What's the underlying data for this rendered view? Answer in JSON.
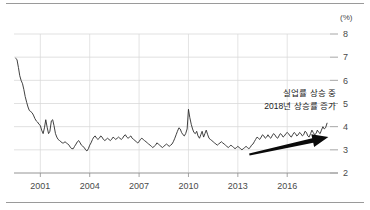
{
  "chart_data": {
    "type": "line",
    "title": "",
    "subtitle": "",
    "xlabel": "",
    "ylabel": "",
    "unit_label": "(%)",
    "xlim": [
      1999.4,
      2018.6
    ],
    "ylim": [
      2,
      8
    ],
    "grid": true,
    "legend": null,
    "y_ticks": [
      8,
      7,
      6,
      5,
      4,
      3,
      2
    ],
    "y_tick_labels": [
      "8",
      "7",
      "6",
      "5",
      "4",
      "3",
      "2"
    ],
    "x_ticks": [
      2001,
      2004,
      2007,
      2010,
      2013,
      2016
    ],
    "x_tick_labels": [
      "2001",
      "2004",
      "2007",
      "2010",
      "2013",
      "2016"
    ],
    "series": [
      {
        "name": "unemployment-rate",
        "color": "#2b2b2b",
        "x": [
          1999.5,
          1999.58,
          1999.67,
          1999.75,
          1999.83,
          1999.92,
          2000.0,
          2000.08,
          2000.17,
          2000.25,
          2000.33,
          2000.42,
          2000.5,
          2000.58,
          2000.67,
          2000.75,
          2000.83,
          2000.92,
          2001.0,
          2001.08,
          2001.17,
          2001.25,
          2001.33,
          2001.42,
          2001.5,
          2001.58,
          2001.67,
          2001.75,
          2001.83,
          2001.92,
          2002.0,
          2002.08,
          2002.17,
          2002.25,
          2002.33,
          2002.42,
          2002.5,
          2002.58,
          2002.67,
          2002.75,
          2002.83,
          2002.92,
          2003.0,
          2003.08,
          2003.17,
          2003.25,
          2003.33,
          2003.42,
          2003.5,
          2003.58,
          2003.67,
          2003.75,
          2003.83,
          2003.92,
          2004.0,
          2004.08,
          2004.17,
          2004.25,
          2004.33,
          2004.42,
          2004.5,
          2004.58,
          2004.67,
          2004.75,
          2004.83,
          2004.92,
          2005.0,
          2005.08,
          2005.17,
          2005.25,
          2005.33,
          2005.42,
          2005.5,
          2005.58,
          2005.67,
          2005.75,
          2005.83,
          2005.92,
          2006.0,
          2006.08,
          2006.17,
          2006.25,
          2006.33,
          2006.42,
          2006.5,
          2006.58,
          2006.67,
          2006.75,
          2006.83,
          2006.92,
          2007.0,
          2007.08,
          2007.17,
          2007.25,
          2007.33,
          2007.42,
          2007.5,
          2007.58,
          2007.67,
          2007.75,
          2007.83,
          2007.92,
          2008.0,
          2008.08,
          2008.17,
          2008.25,
          2008.33,
          2008.42,
          2008.5,
          2008.58,
          2008.67,
          2008.75,
          2008.83,
          2008.92,
          2009.0,
          2009.08,
          2009.17,
          2009.25,
          2009.33,
          2009.42,
          2009.5,
          2009.58,
          2009.67,
          2009.75,
          2009.83,
          2009.92,
          2010.0,
          2010.08,
          2010.17,
          2010.25,
          2010.33,
          2010.42,
          2010.5,
          2010.58,
          2010.67,
          2010.75,
          2010.83,
          2010.92,
          2011.0,
          2011.08,
          2011.17,
          2011.25,
          2011.33,
          2011.42,
          2011.5,
          2011.58,
          2011.67,
          2011.75,
          2011.83,
          2011.92,
          2012.0,
          2012.08,
          2012.17,
          2012.25,
          2012.33,
          2012.42,
          2012.5,
          2012.58,
          2012.67,
          2012.75,
          2012.83,
          2012.92,
          2013.0,
          2013.08,
          2013.17,
          2013.25,
          2013.33,
          2013.42,
          2013.5,
          2013.58,
          2013.67,
          2013.75,
          2013.83,
          2013.92,
          2014.0,
          2014.08,
          2014.17,
          2014.25,
          2014.33,
          2014.42,
          2014.5,
          2014.58,
          2014.67,
          2014.75,
          2014.83,
          2014.92,
          2015.0,
          2015.08,
          2015.17,
          2015.25,
          2015.33,
          2015.42,
          2015.5,
          2015.58,
          2015.67,
          2015.75,
          2015.83,
          2015.92,
          2016.0,
          2016.08,
          2016.17,
          2016.25,
          2016.33,
          2016.42,
          2016.5,
          2016.58,
          2016.67,
          2016.75,
          2016.83,
          2016.92,
          2017.0,
          2017.08,
          2017.17,
          2017.25,
          2017.33,
          2017.42,
          2017.5,
          2017.58,
          2017.67,
          2017.75,
          2017.83,
          2017.92,
          2018.0,
          2018.08,
          2018.17,
          2018.25,
          2018.33,
          2018.42
        ],
        "y": [
          6.95,
          6.9,
          6.55,
          6.2,
          6.0,
          5.85,
          5.6,
          5.3,
          5.05,
          4.85,
          4.7,
          4.65,
          4.6,
          4.5,
          4.35,
          4.25,
          4.2,
          4.1,
          4.05,
          3.85,
          3.7,
          3.95,
          4.3,
          3.95,
          3.7,
          3.8,
          4.25,
          4.3,
          4.05,
          3.7,
          3.55,
          3.45,
          3.4,
          3.35,
          3.3,
          3.3,
          3.35,
          3.3,
          3.25,
          3.2,
          3.1,
          3.05,
          3.05,
          3.15,
          3.25,
          3.35,
          3.4,
          3.3,
          3.2,
          3.15,
          3.1,
          3.0,
          2.95,
          3.05,
          3.2,
          3.3,
          3.45,
          3.55,
          3.6,
          3.5,
          3.45,
          3.5,
          3.6,
          3.55,
          3.45,
          3.4,
          3.45,
          3.5,
          3.45,
          3.4,
          3.45,
          3.55,
          3.5,
          3.45,
          3.5,
          3.55,
          3.5,
          3.45,
          3.5,
          3.6,
          3.65,
          3.55,
          3.5,
          3.55,
          3.6,
          3.5,
          3.45,
          3.4,
          3.35,
          3.3,
          3.35,
          3.45,
          3.5,
          3.45,
          3.4,
          3.35,
          3.3,
          3.25,
          3.2,
          3.15,
          3.1,
          3.15,
          3.2,
          3.3,
          3.25,
          3.2,
          3.15,
          3.1,
          3.15,
          3.2,
          3.25,
          3.2,
          3.15,
          3.2,
          3.25,
          3.35,
          3.5,
          3.65,
          3.8,
          3.95,
          3.9,
          3.75,
          3.65,
          3.6,
          3.7,
          3.9,
          4.75,
          4.4,
          4.1,
          3.9,
          3.75,
          3.7,
          3.8,
          3.6,
          3.5,
          3.65,
          3.8,
          3.55,
          3.7,
          3.85,
          3.65,
          3.5,
          3.45,
          3.4,
          3.35,
          3.3,
          3.25,
          3.2,
          3.25,
          3.3,
          3.35,
          3.3,
          3.25,
          3.2,
          3.15,
          3.1,
          3.15,
          3.2,
          3.15,
          3.1,
          3.05,
          3.1,
          3.15,
          3.1,
          3.05,
          3.0,
          3.05,
          3.1,
          3.15,
          3.1,
          3.05,
          3.1,
          3.2,
          3.25,
          3.35,
          3.45,
          3.55,
          3.5,
          3.45,
          3.55,
          3.65,
          3.6,
          3.5,
          3.55,
          3.65,
          3.55,
          3.5,
          3.6,
          3.7,
          3.65,
          3.55,
          3.5,
          3.6,
          3.7,
          3.65,
          3.55,
          3.6,
          3.7,
          3.75,
          3.7,
          3.6,
          3.55,
          3.65,
          3.75,
          3.7,
          3.6,
          3.65,
          3.75,
          3.7,
          3.6,
          3.65,
          3.8,
          3.75,
          3.6,
          3.55,
          3.7,
          3.85,
          3.75,
          3.65,
          3.7,
          3.85,
          3.75,
          3.7,
          3.85,
          4.0,
          3.9,
          3.95,
          4.15
        ]
      }
    ],
    "annotations": [
      {
        "name": "trend-annotation",
        "lines": [
          "실업률 상승 중",
          "2018년 상승률 증가"
        ]
      },
      {
        "name": "trend-arrow",
        "type": "arrow",
        "from": [
          2013.7,
          2.8
        ],
        "to": [
          2018.5,
          3.55
        ],
        "color": "#0a0a0a"
      }
    ]
  },
  "axes": {
    "unit_label": "(%)",
    "y_tick_labels": [
      "8",
      "7",
      "6",
      "5",
      "4",
      "3",
      "2"
    ],
    "x_tick_labels": [
      "2001",
      "2004",
      "2007",
      "2010",
      "2013",
      "2016"
    ]
  },
  "annotation": {
    "line1": "실업률 상승 중",
    "line2": "2018년 상승률 증가"
  },
  "colors": {
    "series": "#2b2b2b",
    "arrow": "#0a0a0a",
    "grid": "#d4d4d4",
    "axis": "#8f8f8f",
    "text": "#4a4a4a"
  }
}
